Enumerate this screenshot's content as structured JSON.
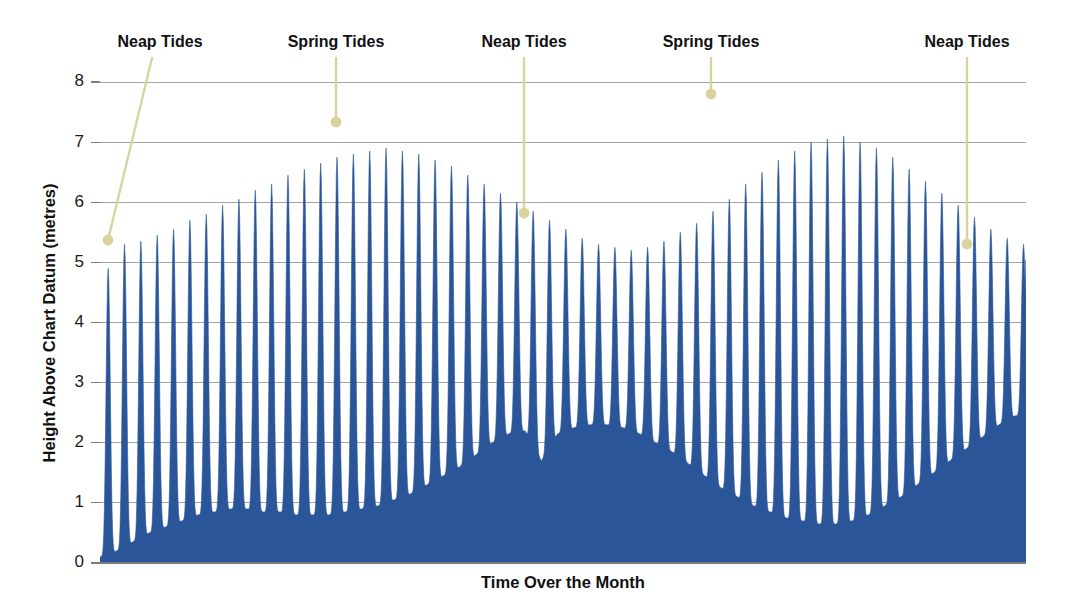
{
  "chart_data": {
    "type": "area",
    "title": "",
    "xlabel": "Time Over the Month",
    "ylabel": "Height Above Chart Datum (metres)",
    "ylim": [
      0,
      8
    ],
    "xlim": [
      0,
      29.5
    ],
    "yticks": [
      0,
      1,
      2,
      3,
      4,
      5,
      6,
      7,
      8
    ],
    "ytick_labels": [
      "0",
      "1",
      "2",
      "3",
      "4",
      "5",
      "6",
      "7",
      "8"
    ],
    "xticks": [],
    "xtick_labels": [],
    "grid": true,
    "legend": "none",
    "series_name": "Tidal height",
    "series_color": "#2a5699",
    "x": [
      0.0,
      0.26,
      0.52,
      0.78,
      1.03,
      1.29,
      1.55,
      1.81,
      2.07,
      2.33,
      2.58,
      2.84,
      3.1,
      3.36,
      3.62,
      3.88,
      4.13,
      4.39,
      4.65,
      4.91,
      5.17,
      5.43,
      5.68,
      5.94,
      6.2,
      6.46,
      6.72,
      6.98,
      7.23,
      7.49,
      7.75,
      8.01,
      8.27,
      8.53,
      8.78,
      9.04,
      9.3,
      9.56,
      9.82,
      10.08,
      10.33,
      10.59,
      10.85,
      11.11,
      11.37,
      11.63,
      11.88,
      12.14,
      12.4,
      12.66,
      12.92,
      13.18,
      13.43,
      13.69,
      13.95,
      14.21,
      14.47
    ],
    "high_tide_values": [
      4.9,
      5.3,
      5.35,
      5.45,
      5.55,
      5.7,
      5.8,
      5.95,
      6.05,
      6.2,
      6.3,
      6.45,
      6.55,
      6.65,
      6.75,
      6.8,
      6.85,
      6.9,
      6.85,
      6.8,
      6.7,
      6.6,
      6.45,
      6.3,
      6.15,
      6.0,
      5.85,
      5.7,
      5.55,
      5.4,
      5.3,
      5.25,
      5.2,
      5.25,
      5.35,
      5.5,
      5.65,
      5.85,
      6.05,
      6.3,
      6.5,
      6.7,
      6.85,
      7.0,
      7.05,
      7.1,
      7.0,
      6.9,
      6.75,
      6.55,
      6.35,
      6.15,
      5.95,
      5.75,
      5.55,
      5.4,
      5.3
    ],
    "low_tide_values": [
      0.1,
      0.2,
      0.35,
      0.5,
      0.6,
      0.7,
      0.8,
      0.85,
      0.9,
      0.9,
      0.85,
      0.85,
      0.8,
      0.8,
      0.8,
      0.85,
      0.9,
      0.95,
      1.05,
      1.15,
      1.3,
      1.45,
      1.6,
      1.8,
      2.0,
      2.15,
      2.2,
      1.7,
      2.15,
      2.25,
      2.3,
      2.3,
      2.25,
      2.15,
      2.0,
      1.85,
      1.65,
      1.45,
      1.25,
      1.1,
      0.95,
      0.85,
      0.75,
      0.7,
      0.65,
      0.65,
      0.7,
      0.8,
      0.95,
      1.1,
      1.3,
      1.5,
      1.7,
      1.9,
      2.1,
      2.3,
      2.45
    ],
    "annotations": [
      {
        "label": "Neap Tides",
        "label_x": 160,
        "label_y": 43,
        "dot_x": 108,
        "dot_y": 240,
        "line_from_x": 152,
        "line_from_y": 58
      },
      {
        "label": "Spring Tides",
        "label_x": 336,
        "label_y": 43,
        "dot_x": 336,
        "dot_y": 122,
        "line_from_x": 336,
        "line_from_y": 58
      },
      {
        "label": "Neap Tides",
        "label_x": 524,
        "label_y": 43,
        "dot_x": 524,
        "dot_y": 213,
        "line_from_x": 524,
        "line_from_y": 58
      },
      {
        "label": "Spring Tides",
        "label_x": 711,
        "label_y": 43,
        "dot_x": 711,
        "dot_y": 94,
        "line_from_x": 711,
        "line_from_y": 58
      },
      {
        "label": "Neap Tides",
        "label_x": 967,
        "label_y": 43,
        "dot_x": 967,
        "dot_y": 244,
        "line_from_x": 967,
        "line_from_y": 58
      }
    ],
    "annotation_color": "#d9d3a0",
    "grid_color": "#9a9a9a",
    "background_color": "#ffffff"
  }
}
